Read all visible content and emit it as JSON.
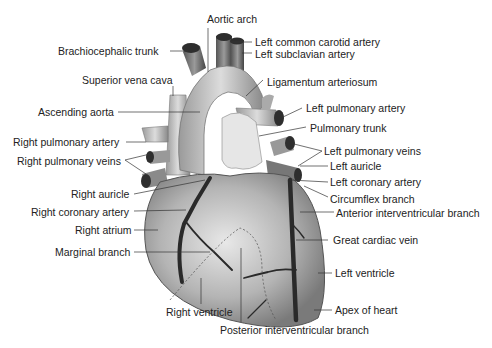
{
  "diagram": {
    "colors": {
      "ink": "#222222",
      "heart_fill": "#b8b8b8",
      "vessel_dark": "#3a3a3a",
      "background": "#ffffff"
    },
    "labels": {
      "aortic_arch": "Aortic arch",
      "brachiocephalic_trunk": "Brachiocephalic trunk",
      "left_common_carotid_artery": "Left common carotid artery",
      "left_subclavian_artery": "Left subclavian artery",
      "superior_vena_cava": "Superior vena cava",
      "ligamentum_arteriosum": "Ligamentum arteriosum",
      "ascending_aorta": "Ascending aorta",
      "left_pulmonary_artery": "Left pulmonary artery",
      "pulmonary_trunk": "Pulmonary trunk",
      "right_pulmonary_artery": "Right pulmonary artery",
      "right_pulmonary_veins": "Right pulmonary veins",
      "left_pulmonary_veins": "Left pulmonary veins",
      "left_auricle": "Left auricle",
      "right_auricle": "Right auricle",
      "left_coronary_artery": "Left coronary artery",
      "circumflex_branch": "Circumflex branch",
      "right_coronary_artery": "Right coronary artery",
      "anterior_interventricular_branch": "Anterior interventricular branch",
      "right_atrium": "Right atrium",
      "great_cardiac_vein": "Great cardiac vein",
      "marginal_branch": "Marginal branch",
      "left_ventricle": "Left ventricle",
      "right_ventricle": "Right ventricle",
      "apex_of_heart": "Apex of heart",
      "posterior_interventricular_branch": "Posterior interventricular branch"
    }
  }
}
